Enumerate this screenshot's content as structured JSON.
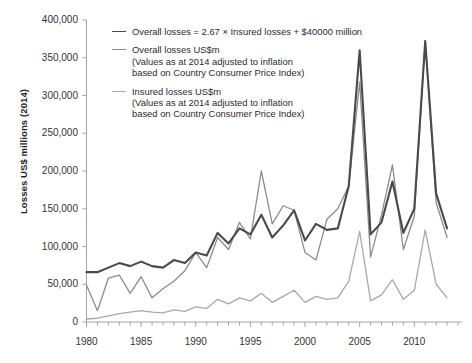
{
  "chart_data": {
    "type": "line",
    "title": "",
    "xlabel": "",
    "ylabel": "Losses US$ millions (2014)",
    "xlim": [
      1980,
      2014
    ],
    "ylim": [
      0,
      400000
    ],
    "grid": false,
    "legend_position": "top-left",
    "y_ticks": [
      "0",
      "50,000",
      "100,000",
      "150,000",
      "200,000",
      "250,000",
      "300,000",
      "350,000",
      "400,000"
    ],
    "y_tick_values": [
      0,
      50000,
      100000,
      150000,
      200000,
      250000,
      300000,
      350000,
      400000
    ],
    "x_ticks": [
      "1980",
      "1985",
      "1990",
      "1995",
      "2000",
      "2005",
      "2010"
    ],
    "x_tick_values": [
      1980,
      1985,
      1990,
      1995,
      2000,
      2005,
      2010
    ],
    "x": [
      1980,
      1981,
      1982,
      1983,
      1984,
      1985,
      1986,
      1987,
      1988,
      1989,
      1990,
      1991,
      1992,
      1993,
      1994,
      1995,
      1996,
      1997,
      1998,
      1999,
      2000,
      2001,
      2002,
      2003,
      2004,
      2005,
      2006,
      2007,
      2008,
      2009,
      2010,
      2011,
      2012,
      2013
    ],
    "series": [
      {
        "name": "Overall losses = 2.67 × Insured losses + $40000 million",
        "color": "#4a4a4a",
        "width": 2.1,
        "values": [
          66000,
          66000,
          72000,
          78000,
          74000,
          80000,
          74000,
          72000,
          82000,
          78000,
          92000,
          88000,
          118000,
          104000,
          124000,
          116000,
          142000,
          112000,
          128000,
          148000,
          108000,
          130000,
          122000,
          124000,
          180000,
          360000,
          116000,
          132000,
          186000,
          118000,
          150000,
          372000,
          170000,
          124000
        ]
      },
      {
        "name": "Overall losses US$m (Values as at 2014 adjusted to inflation based on Country Consumer Price Index)",
        "color": "#8c8c8c",
        "width": 1.3,
        "values": [
          49000,
          15000,
          58000,
          62000,
          38000,
          60000,
          32000,
          44000,
          54000,
          68000,
          92000,
          72000,
          112000,
          96000,
          132000,
          110000,
          200000,
          130000,
          154000,
          148000,
          92000,
          82000,
          136000,
          150000,
          180000,
          318000,
          86000,
          142000,
          208000,
          96000,
          140000,
          372000,
          158000,
          112000
        ]
      },
      {
        "name": "Insured losses US$m (Values as at 2014 adjusted to inflation based on Country Consumer Price Index)",
        "color": "#a8a8a8",
        "width": 1.3,
        "values": [
          4000,
          5000,
          8000,
          11000,
          13000,
          15000,
          13000,
          12000,
          16000,
          14000,
          20000,
          18000,
          30000,
          24000,
          32000,
          28000,
          38000,
          26000,
          34000,
          42000,
          26000,
          34000,
          30000,
          32000,
          54000,
          120000,
          28000,
          36000,
          56000,
          30000,
          42000,
          122000,
          50000,
          32000
        ]
      }
    ]
  },
  "legend": {
    "items": [
      {
        "label": "Overall losses = 2.67 × Insured losses + $40000 million",
        "sub1": "",
        "sub2": "",
        "color": "#4a4a4a"
      },
      {
        "label": "Overall losses US$m",
        "sub1": "(Values as at 2014 adjusted to inflation",
        "sub2": "based on Country Consumer Price Index)",
        "color": "#8c8c8c"
      },
      {
        "label": "Insured losses US$m",
        "sub1": "(Values as at 2014 adjusted to inflation",
        "sub2": "based on Country Consumer Price Index)",
        "color": "#a8a8a8"
      }
    ]
  },
  "axis": {
    "y_title": "Losses US$ millions (2014)"
  }
}
